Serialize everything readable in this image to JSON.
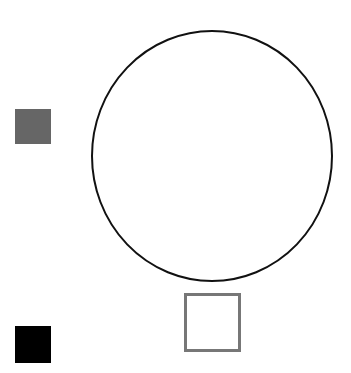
{
  "canvas": {
    "width": 351,
    "height": 373,
    "background": "#ffffff"
  },
  "shapes": [
    {
      "id": "gray-square",
      "type": "rect",
      "x": 15,
      "y": 109,
      "width": 36,
      "height": 35,
      "fill": "#666666",
      "stroke": "none"
    },
    {
      "id": "large-circle",
      "type": "ellipse",
      "cx": 212,
      "cy": 156,
      "rx": 120,
      "ry": 125,
      "fill": "#ffffff",
      "stroke": "#111111",
      "stroke_width": 2
    },
    {
      "id": "outline-square",
      "type": "rect",
      "x": 184,
      "y": 293,
      "width": 57,
      "height": 59,
      "fill": "#ffffff",
      "stroke": "#777777",
      "stroke_width": 3
    },
    {
      "id": "black-square",
      "type": "rect",
      "x": 15,
      "y": 326,
      "width": 36,
      "height": 37,
      "fill": "#000000",
      "stroke": "none"
    }
  ]
}
